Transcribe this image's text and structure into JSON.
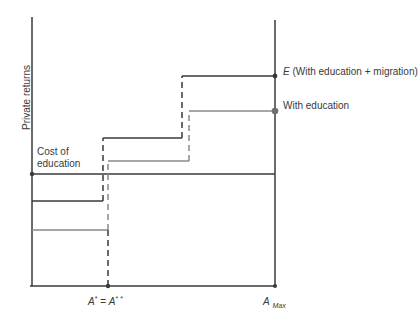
{
  "diagram": {
    "y_axis_label": "Private returns",
    "cost_label_line1": "Cost of",
    "cost_label_line2": "education",
    "curve_E_letter": "E",
    "curve_E_label": " (With education + migration)",
    "curve_edu_label": "With education",
    "x_tick_A_star": "A",
    "x_tick_A_star_sup": "*",
    "x_tick_eq": " = ",
    "x_tick_A_2star": "A",
    "x_tick_A_2star_sup": "* *",
    "x_tick_Amax": "A",
    "x_tick_Amax_sub": "Max",
    "colors": {
      "dark_line": "#3a3a3a",
      "gray_line": "#8a8a8a"
    }
  }
}
